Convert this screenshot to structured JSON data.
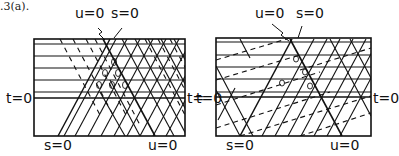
{
  "caption_fragment": ".3(a).",
  "panels": [
    {
      "name": "left",
      "labels": {
        "top_u": "u=0",
        "top_s": "s=0",
        "left_t": "t=0",
        "bottom_s": "s=0",
        "bottom_u": "u=0"
      }
    },
    {
      "name": "right",
      "labels": {
        "top_u": "u=0",
        "top_s": "s=0",
        "left_t": "t=0",
        "right_t": "t=0",
        "bottom_s": "s=0",
        "bottom_u": "u=0"
      }
    }
  ],
  "left_right_t": "t="
}
